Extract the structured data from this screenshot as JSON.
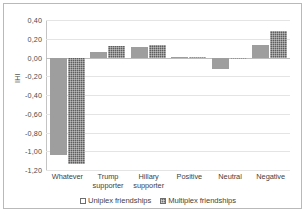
{
  "chart_data": {
    "type": "bar",
    "title": "",
    "xlabel": "",
    "ylabel": "IHI",
    "ylim": [
      -1.2,
      0.4
    ],
    "ytick_step": 0.2,
    "grid": true,
    "legend_position": "bottom",
    "decimal_separator": ",",
    "categories": [
      "Whatever",
      "Trump supporter",
      "Hillary supporter",
      "Positive",
      "Neutral",
      "Negative"
    ],
    "ytick_labels": [
      "0,40",
      "0,20",
      "0,00",
      "-0,20",
      "-0,40",
      "-0,60",
      "-0,80",
      "-1,00",
      "-1,20"
    ],
    "ytick_values": [
      0.4,
      0.2,
      0.0,
      -0.2,
      -0.4,
      -0.6,
      -0.8,
      -1.0,
      -1.2
    ],
    "series": [
      {
        "name": "Uniplex friendships",
        "color": "#9e9e9e",
        "pattern": "solid",
        "values": [
          -1.04,
          0.06,
          0.11,
          0.01,
          -0.12,
          0.13
        ]
      },
      {
        "name": "Multiplex friendships",
        "color": "#5e5e5e",
        "pattern": "checkered",
        "values": [
          -1.14,
          0.12,
          0.13,
          0.01,
          -0.02,
          0.28
        ]
      }
    ]
  },
  "legend": {
    "items": [
      {
        "label": "Uniplex friendships",
        "swatch": "uniplex-swatch-icon"
      },
      {
        "label": "Multiplex friendships",
        "swatch": "multiplex-swatch-icon"
      }
    ]
  }
}
